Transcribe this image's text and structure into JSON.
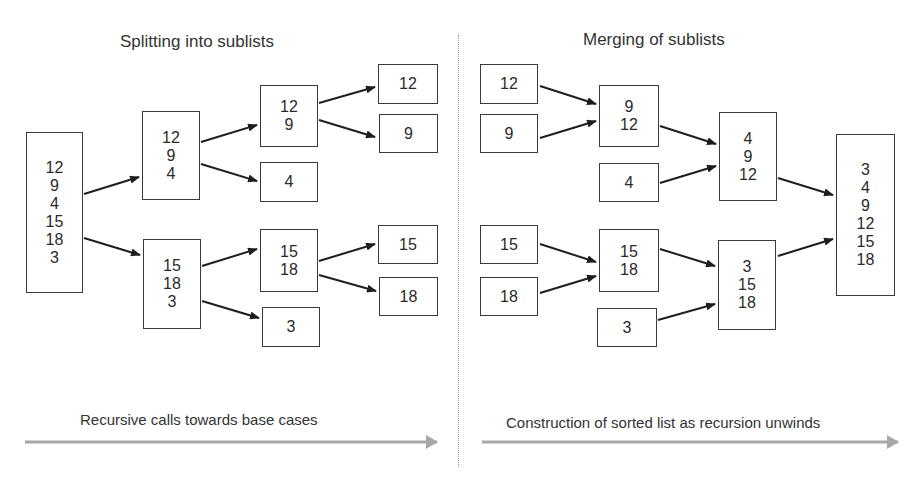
{
  "left_panel": {
    "title": "Splitting into sublists",
    "caption": "Recursive calls towards base cases",
    "boxes": [
      {
        "id": "A",
        "values": [
          "12",
          "9",
          "4",
          "15",
          "18",
          "3"
        ],
        "x": 26,
        "y": 132,
        "w": 57,
        "h": 161
      },
      {
        "id": "B",
        "values": [
          "12",
          "9",
          "4"
        ],
        "x": 142,
        "y": 111,
        "w": 58,
        "h": 89
      },
      {
        "id": "C",
        "values": [
          "12",
          "9"
        ],
        "x": 260,
        "y": 85,
        "w": 58,
        "h": 62
      },
      {
        "id": "D",
        "values": [
          "12"
        ],
        "x": 378,
        "y": 64,
        "w": 60,
        "h": 40
      },
      {
        "id": "E",
        "values": [
          "9"
        ],
        "x": 379,
        "y": 114,
        "w": 59,
        "h": 39
      },
      {
        "id": "F",
        "values": [
          "4"
        ],
        "x": 260,
        "y": 162,
        "w": 58,
        "h": 40
      },
      {
        "id": "G",
        "values": [
          "15",
          "18",
          "3"
        ],
        "x": 143,
        "y": 239,
        "w": 58,
        "h": 90
      },
      {
        "id": "H",
        "values": [
          "15",
          "18"
        ],
        "x": 260,
        "y": 229,
        "w": 58,
        "h": 63
      },
      {
        "id": "I",
        "values": [
          "15"
        ],
        "x": 378,
        "y": 225,
        "w": 60,
        "h": 39
      },
      {
        "id": "J",
        "values": [
          "18"
        ],
        "x": 379,
        "y": 277,
        "w": 59,
        "h": 39
      },
      {
        "id": "K",
        "values": [
          "3"
        ],
        "x": 262,
        "y": 307,
        "w": 58,
        "h": 40
      }
    ]
  },
  "right_panel": {
    "title": "Merging of sublists",
    "caption": "Construction of sorted list as recursion unwinds",
    "boxes": [
      {
        "id": "R12",
        "values": [
          "12"
        ],
        "x": 480,
        "y": 64,
        "w": 58,
        "h": 40
      },
      {
        "id": "R9",
        "values": [
          "9"
        ],
        "x": 480,
        "y": 114,
        "w": 58,
        "h": 39
      },
      {
        "id": "R9_12",
        "values": [
          "9",
          "12"
        ],
        "x": 599,
        "y": 85,
        "w": 60,
        "h": 62
      },
      {
        "id": "R4",
        "values": [
          "4"
        ],
        "x": 599,
        "y": 163,
        "w": 60,
        "h": 39
      },
      {
        "id": "R4_9_12",
        "values": [
          "4",
          "9",
          "12"
        ],
        "x": 719,
        "y": 112,
        "w": 58,
        "h": 89
      },
      {
        "id": "RFinal",
        "values": [
          "3",
          "4",
          "9",
          "12",
          "15",
          "18"
        ],
        "x": 836,
        "y": 134,
        "w": 59,
        "h": 162
      },
      {
        "id": "R15",
        "values": [
          "15"
        ],
        "x": 480,
        "y": 225,
        "w": 58,
        "h": 39
      },
      {
        "id": "R18",
        "values": [
          "18"
        ],
        "x": 480,
        "y": 277,
        "w": 58,
        "h": 39
      },
      {
        "id": "R15_18",
        "values": [
          "15",
          "18"
        ],
        "x": 599,
        "y": 229,
        "w": 60,
        "h": 63
      },
      {
        "id": "R3",
        "values": [
          "3"
        ],
        "x": 597,
        "y": 308,
        "w": 60,
        "h": 39
      },
      {
        "id": "R3_15_18",
        "values": [
          "3",
          "15",
          "18"
        ],
        "x": 718,
        "y": 240,
        "w": 58,
        "h": 90
      }
    ]
  },
  "colors": {
    "box_border": "#3a3a3a",
    "arrow": "#1e1e1e",
    "progress_arrow": "#a8a8a8",
    "divider": "#999999"
  }
}
